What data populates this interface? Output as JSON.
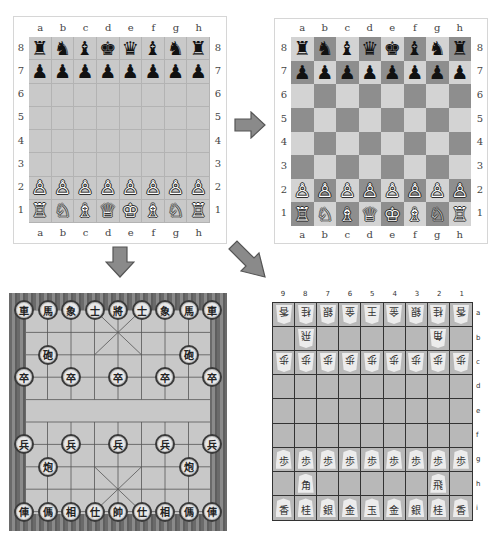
{
  "colors": {
    "chess_plain_square": "#c9c9c9",
    "chess_light_square": "#d3d3d3",
    "chess_dark_square": "#8e8e8e",
    "arrow_fill": "#8a8a8a",
    "arrow_stroke": "#555555",
    "xiangqi_board": "#c8c8c8",
    "xiangqi_border": "#777777",
    "shogi_board": "#b8b8b8"
  },
  "chess_plain": {
    "files": [
      "a",
      "b",
      "c",
      "d",
      "e",
      "f",
      "g",
      "h"
    ],
    "ranks": [
      "8",
      "7",
      "6",
      "5",
      "4",
      "3",
      "2",
      "1"
    ],
    "rows": [
      [
        "♜",
        "♞",
        "♝",
        "♚",
        "♛",
        "♝",
        "♞",
        "♜"
      ],
      [
        "♟",
        "♟",
        "♟",
        "♟",
        "♟",
        "♟",
        "♟",
        "♟"
      ],
      [
        "",
        "",
        "",
        "",
        "",
        "",
        "",
        ""
      ],
      [
        "",
        "",
        "",
        "",
        "",
        "",
        "",
        ""
      ],
      [
        "",
        "",
        "",
        "",
        "",
        "",
        "",
        ""
      ],
      [
        "",
        "",
        "",
        "",
        "",
        "",
        "",
        ""
      ],
      [
        "♙",
        "♙",
        "♙",
        "♙",
        "♙",
        "♙",
        "♙",
        "♙"
      ],
      [
        "♖",
        "♘",
        "♗",
        "♕",
        "♔",
        "♗",
        "♘",
        "♖"
      ]
    ]
  },
  "chess_checkered": {
    "files": [
      "a",
      "b",
      "c",
      "d",
      "e",
      "f",
      "g",
      "h"
    ],
    "ranks": [
      "8",
      "7",
      "6",
      "5",
      "4",
      "3",
      "2",
      "1"
    ],
    "rows": [
      [
        "♜",
        "♞",
        "♝",
        "♛",
        "♚",
        "♝",
        "♞",
        "♜"
      ],
      [
        "♟",
        "♟",
        "♟",
        "♟",
        "♟",
        "♟",
        "♟",
        "♟"
      ],
      [
        "",
        "",
        "",
        "",
        "",
        "",
        "",
        ""
      ],
      [
        "",
        "",
        "",
        "",
        "",
        "",
        "",
        ""
      ],
      [
        "",
        "",
        "",
        "",
        "",
        "",
        "",
        ""
      ],
      [
        "",
        "",
        "",
        "",
        "",
        "",
        "",
        ""
      ],
      [
        "♙",
        "♙",
        "♙",
        "♙",
        "♙",
        "♙",
        "♙",
        "♙"
      ],
      [
        "♖",
        "♘",
        "♗",
        "♕",
        "♔",
        "♗",
        "♘",
        "♖"
      ]
    ]
  },
  "arrows": [
    {
      "name": "arrow-right",
      "direction": "right"
    },
    {
      "name": "arrow-down",
      "direction": "down"
    },
    {
      "name": "arrow-down-right",
      "direction": "down-right"
    }
  ],
  "xiangqi": {
    "pieces": [
      {
        "row": 0,
        "col": 0,
        "label": "車"
      },
      {
        "row": 0,
        "col": 1,
        "label": "馬"
      },
      {
        "row": 0,
        "col": 2,
        "label": "象"
      },
      {
        "row": 0,
        "col": 3,
        "label": "士"
      },
      {
        "row": 0,
        "col": 4,
        "label": "將"
      },
      {
        "row": 0,
        "col": 5,
        "label": "士"
      },
      {
        "row": 0,
        "col": 6,
        "label": "象"
      },
      {
        "row": 0,
        "col": 7,
        "label": "馬"
      },
      {
        "row": 0,
        "col": 8,
        "label": "車"
      },
      {
        "row": 2,
        "col": 1,
        "label": "砲"
      },
      {
        "row": 2,
        "col": 7,
        "label": "砲"
      },
      {
        "row": 3,
        "col": 0,
        "label": "卒"
      },
      {
        "row": 3,
        "col": 2,
        "label": "卒"
      },
      {
        "row": 3,
        "col": 4,
        "label": "卒"
      },
      {
        "row": 3,
        "col": 6,
        "label": "卒"
      },
      {
        "row": 3,
        "col": 8,
        "label": "卒"
      },
      {
        "row": 6,
        "col": 0,
        "label": "兵"
      },
      {
        "row": 6,
        "col": 2,
        "label": "兵"
      },
      {
        "row": 6,
        "col": 4,
        "label": "兵"
      },
      {
        "row": 6,
        "col": 6,
        "label": "兵"
      },
      {
        "row": 6,
        "col": 8,
        "label": "兵"
      },
      {
        "row": 7,
        "col": 1,
        "label": "炮"
      },
      {
        "row": 7,
        "col": 7,
        "label": "炮"
      },
      {
        "row": 9,
        "col": 0,
        "label": "俥"
      },
      {
        "row": 9,
        "col": 1,
        "label": "傌"
      },
      {
        "row": 9,
        "col": 2,
        "label": "相"
      },
      {
        "row": 9,
        "col": 3,
        "label": "仕"
      },
      {
        "row": 9,
        "col": 4,
        "label": "帥"
      },
      {
        "row": 9,
        "col": 5,
        "label": "仕"
      },
      {
        "row": 9,
        "col": 6,
        "label": "相"
      },
      {
        "row": 9,
        "col": 7,
        "label": "傌"
      },
      {
        "row": 9,
        "col": 8,
        "label": "俥"
      }
    ]
  },
  "shogi": {
    "col_labels": [
      "9",
      "8",
      "7",
      "6",
      "5",
      "4",
      "3",
      "2",
      "1"
    ],
    "row_labels": [
      "a",
      "b",
      "c",
      "d",
      "e",
      "f",
      "g",
      "h",
      "i"
    ],
    "rows": [
      [
        {
          "l": "香",
          "g": 1
        },
        {
          "l": "桂",
          "g": 1
        },
        {
          "l": "銀",
          "g": 1
        },
        {
          "l": "金",
          "g": 1
        },
        {
          "l": "王",
          "g": 1
        },
        {
          "l": "金",
          "g": 1
        },
        {
          "l": "銀",
          "g": 1
        },
        {
          "l": "桂",
          "g": 1
        },
        {
          "l": "香",
          "g": 1
        }
      ],
      [
        null,
        {
          "l": "飛",
          "g": 1
        },
        null,
        null,
        null,
        null,
        null,
        {
          "l": "角",
          "g": 1
        },
        null
      ],
      [
        {
          "l": "歩",
          "g": 1
        },
        {
          "l": "歩",
          "g": 1
        },
        {
          "l": "歩",
          "g": 1
        },
        {
          "l": "歩",
          "g": 1
        },
        {
          "l": "歩",
          "g": 1
        },
        {
          "l": "歩",
          "g": 1
        },
        {
          "l": "歩",
          "g": 1
        },
        {
          "l": "歩",
          "g": 1
        },
        {
          "l": "歩",
          "g": 1
        }
      ],
      [
        null,
        null,
        null,
        null,
        null,
        null,
        null,
        null,
        null
      ],
      [
        null,
        null,
        null,
        null,
        null,
        null,
        null,
        null,
        null
      ],
      [
        null,
        null,
        null,
        null,
        null,
        null,
        null,
        null,
        null
      ],
      [
        {
          "l": "歩",
          "g": 0
        },
        {
          "l": "歩",
          "g": 0
        },
        {
          "l": "歩",
          "g": 0
        },
        {
          "l": "歩",
          "g": 0
        },
        {
          "l": "歩",
          "g": 0
        },
        {
          "l": "歩",
          "g": 0
        },
        {
          "l": "歩",
          "g": 0
        },
        {
          "l": "歩",
          "g": 0
        },
        {
          "l": "歩",
          "g": 0
        }
      ],
      [
        null,
        {
          "l": "角",
          "g": 0
        },
        null,
        null,
        null,
        null,
        null,
        {
          "l": "飛",
          "g": 0
        },
        null
      ],
      [
        {
          "l": "香",
          "g": 0
        },
        {
          "l": "桂",
          "g": 0
        },
        {
          "l": "銀",
          "g": 0
        },
        {
          "l": "金",
          "g": 0
        },
        {
          "l": "玉",
          "g": 0
        },
        {
          "l": "金",
          "g": 0
        },
        {
          "l": "銀",
          "g": 0
        },
        {
          "l": "桂",
          "g": 0
        },
        {
          "l": "香",
          "g": 0
        }
      ]
    ]
  }
}
